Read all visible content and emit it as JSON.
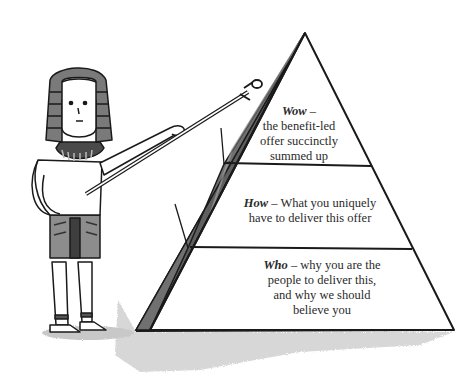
{
  "diagram": {
    "type": "pyramid",
    "tiers": [
      {
        "level": "top",
        "keyword": "Wow",
        "separator": "–",
        "description_lines": [
          "the benefit-led",
          "offer succinctly",
          "summed up"
        ]
      },
      {
        "level": "middle",
        "keyword": "How",
        "separator": "–",
        "description_lines": [
          "What you uniquely",
          "have to deliver this offer"
        ]
      },
      {
        "level": "bottom",
        "keyword": "Who",
        "separator": "–",
        "description_lines": [
          "why you are the",
          "people to deliver this,",
          "and why we should",
          "believe you"
        ]
      }
    ],
    "illustration": {
      "figure": "pharaoh",
      "pointer": "ankh-staff",
      "pointing_at": "pyramid"
    },
    "colors": {
      "outline": "#1a1a1a",
      "shadow": "#9a9a9a",
      "side_face": "#6b6b6b",
      "headdress_stripe": "#7a7a7a",
      "text": "#2a2a2a"
    }
  }
}
